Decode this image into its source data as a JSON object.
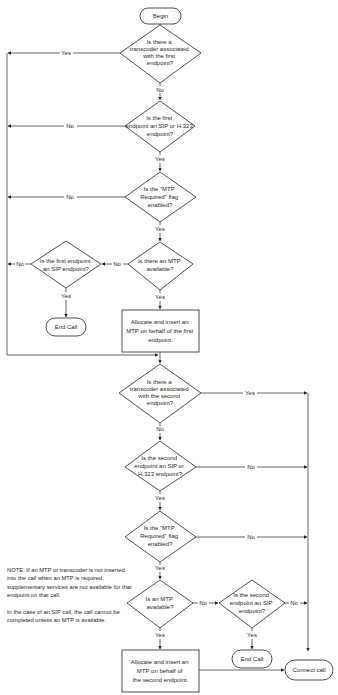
{
  "diagram": {
    "type": "flowchart",
    "nodes": {
      "begin": {
        "label": "Begin",
        "kind": "terminal"
      },
      "d1": {
        "kind": "decision",
        "lines": [
          "Is there a",
          "transcoder associated",
          "with the first",
          "endpoint?"
        ]
      },
      "d2": {
        "kind": "decision",
        "lines": [
          "Is the first",
          "endpoint an SIP or H.323",
          "endpoint?"
        ]
      },
      "d3": {
        "kind": "decision",
        "lines": [
          "Is the \"MTP",
          "Required\" flag",
          "enabled?"
        ]
      },
      "d4": {
        "kind": "decision",
        "lines": [
          "Is there an MTP",
          "available?"
        ]
      },
      "d5": {
        "kind": "decision",
        "lines": [
          "Is the first endpoint",
          "an SIP endpoint?"
        ]
      },
      "end1": {
        "label": "End Call",
        "kind": "terminal"
      },
      "box1": {
        "kind": "process",
        "lines": [
          "Allocate and insert an",
          "MTP on behalf of the first",
          "endpoint."
        ]
      },
      "d6": {
        "kind": "decision",
        "lines": [
          "Is there a",
          "transcoder associated",
          "with the second",
          "endpoint?"
        ]
      },
      "d7": {
        "kind": "decision",
        "lines": [
          "Is the second",
          "endpoint an SIP or",
          "H.323 endpoint?"
        ]
      },
      "d8": {
        "kind": "decision",
        "lines": [
          "Is the \"MTP",
          "Required\" flag",
          "enabled?"
        ]
      },
      "d9": {
        "kind": "decision",
        "lines": [
          "Is an MTP",
          "available?"
        ]
      },
      "d10": {
        "kind": "decision",
        "lines": [
          "Is the second",
          "endpoint an SIP",
          "endpoint?"
        ]
      },
      "end2": {
        "label": "End Call",
        "kind": "terminal"
      },
      "box2": {
        "kind": "process",
        "lines": [
          "Allocate and insert an",
          "MTP on behalf of",
          "the second endpoint."
        ]
      },
      "connect": {
        "label": "Connect call",
        "kind": "terminal"
      }
    },
    "edges": {
      "d1_yes": "Yes",
      "d1_no": "No",
      "d2_no": "No",
      "d2_yes": "Yes",
      "d3_no": "No",
      "d3_yes": "Yes",
      "d4_no": "No",
      "d4_yes": "Yes",
      "d5_no": "No",
      "d5_yes": "Yes",
      "d6_yes": "Yes",
      "d6_no": "No",
      "d7_no": "No",
      "d7_yes": "Yes",
      "d8_no": "No",
      "d8_yes": "Yes",
      "d9_no": "No",
      "d9_yes": "Yes",
      "d10_no": "No",
      "d10_yes": "Yes"
    },
    "note": {
      "paragraphs": [
        "NOTE: If an MTP or transcoder is not inserted into the call when an MTP is required, supplementary services are not available for that endpoint on that call.",
        "In the case of an SIP call, the call cannot be completed unless an MTP is available."
      ]
    }
  }
}
